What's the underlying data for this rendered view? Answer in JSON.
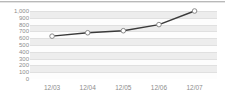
{
  "chart_data": {
    "type": "line",
    "title": "",
    "subtitle": "",
    "xlabel": "",
    "ylabel": "",
    "categories": [
      "12/03",
      "12/04",
      "12/05",
      "12/06",
      "12/07"
    ],
    "series": [
      {
        "name": "series-1",
        "values": [
          630,
          680,
          710,
          800,
          1000
        ]
      }
    ],
    "ylim": [
      0,
      1000
    ],
    "ytick_labels": [
      "1,000",
      "900",
      "800",
      "700",
      "600",
      "500",
      "400",
      "300",
      "200",
      "100",
      "0"
    ],
    "ytick_values": [
      1000,
      900,
      800,
      700,
      600,
      500,
      400,
      300,
      200,
      100,
      0
    ],
    "grid": true,
    "grid_style": "alternating-horizontal-bands",
    "legend": false,
    "legend_position": "none",
    "marker": "open-circle",
    "colors": {
      "line": "#3a3a3a",
      "marker_fill": "#ffffff",
      "marker_stroke": "#8a8a8a",
      "band": "#ededed",
      "gridline": "#e0e0e0",
      "axis_text": "#8d8d8d",
      "plot_background": "#fdfdfd",
      "page_background": "#ffffff",
      "top_rule": "#b9b9b9"
    }
  }
}
